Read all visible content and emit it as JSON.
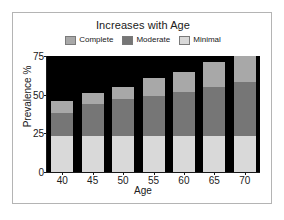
{
  "figure": {
    "title": "Increases with Age",
    "background_color": "#ffffff",
    "frame_color": "#b4b4b4"
  },
  "legend": {
    "position": "top-center",
    "entries": [
      {
        "label": "Complete",
        "color": "#a8a8a8",
        "swatch": "legend-swatch-complete"
      },
      {
        "label": "Moderate",
        "color": "#767676",
        "swatch": "legend-swatch-moderate"
      },
      {
        "label": "Minimal",
        "color": "#d9d9d9",
        "swatch": "legend-swatch-minimal"
      }
    ]
  },
  "axes": {
    "x_label": "Age",
    "y_label": "Prevalence %",
    "y_ticks": [
      "0",
      "25",
      "50",
      "75"
    ],
    "x_ticks": [
      "40",
      "45",
      "50",
      "55",
      "60",
      "65",
      "70"
    ]
  },
  "chart_data": {
    "type": "bar",
    "stacked": true,
    "title": "Increases with Age",
    "xlabel": "Age",
    "ylabel": "Prevalence %",
    "categories": [
      "40",
      "45",
      "50",
      "55",
      "60",
      "65",
      "70"
    ],
    "ylim": [
      0,
      75
    ],
    "yticks": [
      0,
      25,
      50,
      75
    ],
    "grid": false,
    "legend_position": "top-center",
    "plot_background": "#000000",
    "series": [
      {
        "name": "Minimal",
        "color": "#d9d9d9",
        "values": [
          23,
          23,
          23,
          23,
          23,
          23,
          23
        ]
      },
      {
        "name": "Moderate",
        "color": "#767676",
        "values": [
          15,
          21,
          24,
          26,
          29,
          32,
          35
        ]
      },
      {
        "name": "Complete",
        "color": "#a8a8a8",
        "values": [
          8,
          7,
          8,
          12,
          13,
          16,
          17
        ]
      }
    ],
    "totals": [
      46,
      51,
      55,
      61,
      65,
      71,
      75
    ],
    "stack_order_bottom_to_top": [
      "Minimal",
      "Moderate",
      "Complete"
    ]
  }
}
